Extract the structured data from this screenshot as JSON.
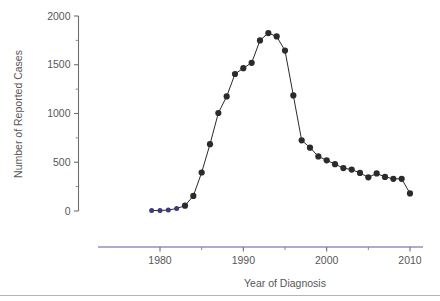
{
  "figure": {
    "background_color": "#ffffff",
    "axis_color": "#6f6f6f",
    "x_axis_color": "#5b5ba0",
    "marker_color": "#2b2b2b",
    "early_marker_color": "#3b3b7a",
    "line_color": "#2b2b2b",
    "footer_rule_color": "#b4b4b4"
  },
  "chart_data": {
    "type": "line",
    "title": "",
    "subtitle": "",
    "xlabel": "Year of Diagnosis",
    "ylabel": "Number of Reported Cases",
    "xlim": [
      1976,
      2011
    ],
    "ylim": [
      0,
      2000
    ],
    "grid": false,
    "legend": null,
    "legend_position": "none",
    "x_ticks_major": [
      1980,
      1990,
      2000,
      2010
    ],
    "x_tick_labels": [
      "1980",
      "1990",
      "2000",
      "2010"
    ],
    "x_ticks_minor": [
      1985,
      1995,
      2005
    ],
    "y_ticks_major": [
      0,
      500,
      1000,
      1500,
      2000
    ],
    "y_tick_labels": [
      "0",
      "500",
      "1000",
      "1500",
      "2000"
    ],
    "y_ticks_minor": [
      250,
      750,
      1250,
      1750
    ],
    "marker": "filled-circle",
    "x": [
      1979,
      1980,
      1981,
      1982,
      1983,
      1984,
      1985,
      1986,
      1987,
      1988,
      1989,
      1990,
      1991,
      1992,
      1993,
      1994,
      1995,
      1996,
      1997,
      1998,
      1999,
      2000,
      2001,
      2002,
      2003,
      2004,
      2005,
      2006,
      2007,
      2008,
      2009,
      2010
    ],
    "values": [
      5,
      5,
      10,
      25,
      55,
      155,
      395,
      685,
      1005,
      1175,
      1405,
      1465,
      1520,
      1750,
      1825,
      1790,
      1645,
      1185,
      725,
      650,
      560,
      520,
      480,
      440,
      425,
      390,
      345,
      385,
      350,
      330,
      330,
      180
    ],
    "series": [
      {
        "name": "Reported Cases",
        "values": [
          5,
          5,
          10,
          25,
          55,
          155,
          395,
          685,
          1005,
          1175,
          1405,
          1465,
          1520,
          1750,
          1825,
          1790,
          1645,
          1185,
          725,
          650,
          560,
          520,
          480,
          440,
          425,
          390,
          345,
          385,
          350,
          330,
          330,
          180
        ]
      }
    ]
  }
}
